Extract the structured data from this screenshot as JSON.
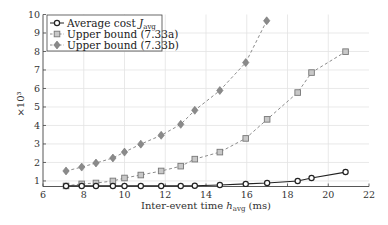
{
  "chart_data": {
    "type": "line",
    "title": "",
    "xlabel": "Inter-event time h_avg (ms)",
    "xlabel_main": "Inter-event time ",
    "xlabel_var": "h",
    "xlabel_sub": "avg",
    "xlabel_unit": " (ms)",
    "ylabel": "×10³",
    "xlim": [
      6,
      22
    ],
    "ylim": [
      0.7,
      10
    ],
    "xticks": [
      6,
      8,
      10,
      12,
      14,
      16,
      18,
      20,
      22
    ],
    "yticks": [
      1,
      2,
      3,
      4,
      5,
      6,
      7,
      8,
      9,
      10
    ],
    "grid": true,
    "legend_position": "upper left",
    "series": [
      {
        "name": "Average cost J_avg",
        "legend_label": "Average cost ",
        "legend_var": "J",
        "legend_sub": "avg",
        "marker": "circle",
        "line": "solid",
        "color": "#222222",
        "x": [
          7.13,
          7.9,
          8.6,
          9.43,
          10.0,
          10.8,
          11.8,
          12.76,
          13.45,
          14.68,
          15.95,
          17.0,
          18.5,
          19.18,
          20.85
        ],
        "y": [
          0.73,
          0.73,
          0.73,
          0.73,
          0.73,
          0.73,
          0.73,
          0.73,
          0.74,
          0.78,
          0.84,
          0.89,
          1.0,
          1.16,
          1.48
        ]
      },
      {
        "name": "Upper bound (7.33a)",
        "legend_label": "Upper bound (7.33a)",
        "marker": "square",
        "line": "dashed",
        "color": "#888888",
        "x": [
          7.13,
          7.9,
          8.6,
          9.43,
          10.0,
          10.8,
          11.8,
          12.76,
          13.45,
          14.68,
          15.95,
          17.0,
          18.5,
          19.18,
          20.85
        ],
        "y": [
          0.73,
          0.84,
          0.89,
          1.0,
          1.16,
          1.32,
          1.54,
          1.8,
          2.18,
          2.56,
          3.3,
          4.33,
          5.78,
          6.86,
          7.99
        ]
      },
      {
        "name": "Upper bound (7.33b)",
        "legend_label": "Upper bound (7.33b)",
        "marker": "diamond",
        "line": "dashed",
        "color": "#888888",
        "x": [
          7.13,
          7.9,
          8.6,
          9.43,
          10.0,
          10.8,
          11.8,
          12.76,
          13.45,
          14.68,
          15.95,
          16.98
        ],
        "y": [
          1.54,
          1.75,
          1.97,
          2.24,
          2.56,
          2.99,
          3.47,
          4.06,
          4.82,
          5.89,
          7.4,
          9.66
        ]
      }
    ]
  }
}
